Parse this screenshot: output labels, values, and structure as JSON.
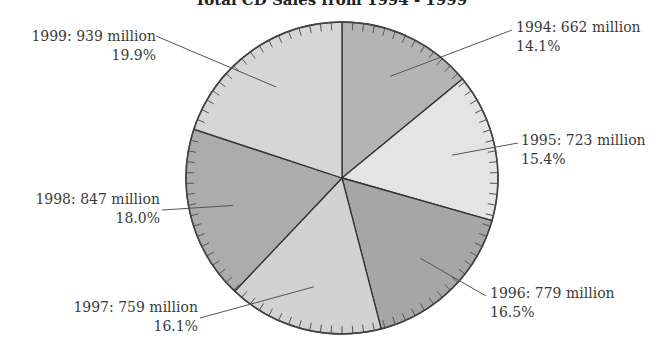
{
  "chart_data": {
    "type": "pie",
    "title": "Total CD Sales from 1994 - 1999",
    "unit": "million",
    "categories": [
      "1994",
      "1995",
      "1996",
      "1997",
      "1998",
      "1999"
    ],
    "values": [
      662,
      723,
      779,
      759,
      847,
      939
    ],
    "percentages": [
      14.1,
      15.4,
      16.5,
      16.1,
      18.0,
      19.9
    ],
    "labels": [
      {
        "line1": "1994: 662 million",
        "line2": "14.1%"
      },
      {
        "line1": "1995: 723 million",
        "line2": "15.4%"
      },
      {
        "line1": "1996: 779 million",
        "line2": "16.5%"
      },
      {
        "line1": "1997: 759 million",
        "line2": "16.1%"
      },
      {
        "line1": "1998: 847 million",
        "line2": "18.0%"
      },
      {
        "line1": "1999: 939 million",
        "line2": "19.9%"
      }
    ],
    "colors": [
      "#b4b4b4",
      "#e4e4e4",
      "#a6a6a6",
      "#d2d2d2",
      "#acacac",
      "#d6d6d6"
    ],
    "start_angle_deg": 0,
    "direction": "clockwise",
    "legend": "none"
  }
}
